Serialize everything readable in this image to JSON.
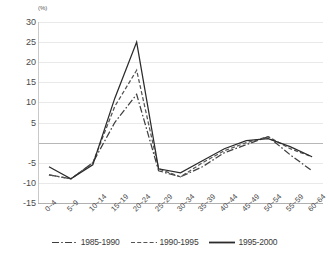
{
  "chart_data": {
    "type": "line",
    "title": "",
    "xlabel": "",
    "ylabel": "(%)",
    "yunit": "(%)",
    "ylim": [
      -15,
      30
    ],
    "ytick_step": 5,
    "yticks": [
      "30",
      "25",
      "20",
      "15",
      "10",
      "5",
      "",
      "-5",
      "-10",
      "-15"
    ],
    "ytick_values": [
      30,
      25,
      20,
      15,
      10,
      5,
      0,
      -5,
      -10,
      -15
    ],
    "grid": true,
    "legend_position": "bottom",
    "categories": [
      "0~4",
      "5~9",
      "10~14",
      "15~19",
      "20~24",
      "25~29",
      "30~34",
      "35~39",
      "40~44",
      "45~49",
      "50~54",
      "55~59",
      "60~64"
    ],
    "series": [
      {
        "name": "1985-1990",
        "style": "dash-dot",
        "color": "#3f3f3f",
        "values": [
          -8,
          -9,
          -5,
          5,
          12,
          -7,
          -8.5,
          -6,
          -2.5,
          -0.5,
          1.5,
          -3,
          -7
        ]
      },
      {
        "name": "1990-1995",
        "style": "dashed",
        "color": "#545454",
        "values": [
          -8,
          -9,
          -5,
          9,
          18,
          -6.5,
          -8.5,
          -5,
          -2,
          0,
          1.5,
          -1.5,
          -3.5
        ]
      },
      {
        "name": "1995-2000",
        "style": "solid",
        "color": "#2b2b2b",
        "values": [
          -6,
          -9,
          -5.5,
          11,
          25,
          -6.5,
          -7.5,
          -4.5,
          -1.5,
          0.5,
          1,
          -1,
          -3.5
        ]
      }
    ]
  }
}
